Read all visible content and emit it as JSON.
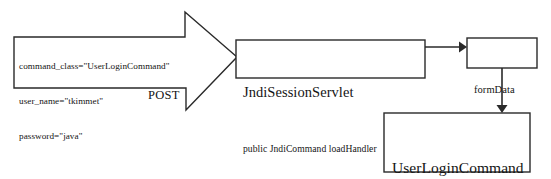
{
  "diagram": {
    "type": "flow-diagram",
    "background_color": "#ffffff",
    "stroke_color": "#222222",
    "text_color": "#141414",
    "request_arrow": {
      "name": "http-post-request-arrow",
      "label": "POST",
      "params": [
        "command_class=\"UserLoginCommand\"",
        "user_name=\"tkimmet\"",
        "password=\"java\""
      ]
    },
    "nodes": [
      {
        "id": "servlet",
        "title": "JndiSessionServlet",
        "subtitle": "public JndiCommand loadHandler"
      },
      {
        "id": "form_data",
        "title": "formData",
        "subtitle": ""
      },
      {
        "id": "command",
        "title": "UserLoginCommand",
        "subtitle": "public void processCommand"
      }
    ],
    "connectors": [
      {
        "id": "servlet-to-formdata",
        "from": "servlet",
        "to": "form_data",
        "direction": "right"
      },
      {
        "id": "formdata-to-command",
        "from": "form_data",
        "to": "command",
        "direction": "down"
      }
    ]
  }
}
